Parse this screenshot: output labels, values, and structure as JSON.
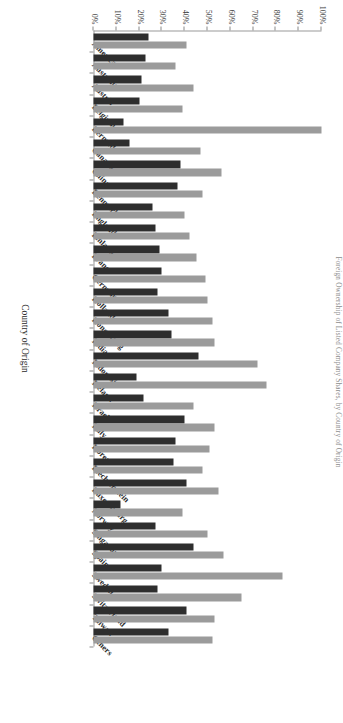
{
  "title": "Foreign Ownership of Listed Company Shares, by Country of Origin",
  "axis": {
    "value_title": "",
    "category_title": "Country of Origin",
    "value_ticks": [
      "100%",
      "90%",
      "80%",
      "70%",
      "60%",
      "50%",
      "40%",
      "30%",
      "20%",
      "10%",
      "0%"
    ],
    "value_min": 0,
    "value_max": 100
  },
  "colors": {
    "series_dark": "#2e2e2e",
    "series_light": "#9b9b9b",
    "axis": "#9a9a9a",
    "text": "#2b2b2b",
    "title": "#8d8d8d",
    "background": "#ffffff"
  },
  "chart_data": {
    "type": "bar",
    "title": "Foreign Ownership of Listed Company Shares, by Country of Origin",
    "xlabel": "Country of Origin",
    "ylabel": "",
    "ylim": [
      0,
      100
    ],
    "grid": false,
    "legend_position": "none",
    "orientation": "horizontal-rotated",
    "categories": [
      "America",
      "Australia",
      "Austria",
      "Belgium",
      "Bermuda",
      "Canada",
      "China",
      "Denmark",
      "England",
      "Finland",
      "France",
      "Germany",
      "Holland",
      "Hong Kong",
      "India",
      "Indonesia",
      "Ireland",
      "Israel",
      "Italy",
      "Korea",
      "Liechtenstein",
      "Luxembourg",
      "Norway",
      "Singapore",
      "Spain",
      "Sweden",
      "Switzerland",
      "Taiwan",
      "Others"
    ],
    "series": [
      {
        "name": "Series 1",
        "values": [
          24,
          23,
          21,
          20,
          13,
          16,
          38,
          37,
          26,
          27,
          29,
          30,
          28,
          33,
          34,
          46,
          19,
          22,
          40,
          36,
          35,
          41,
          12,
          27,
          44,
          30,
          28,
          41,
          33
        ]
      },
      {
        "name": "Series 2",
        "values": [
          41,
          36,
          44,
          39,
          100,
          47,
          56,
          48,
          40,
          42,
          45,
          49,
          50,
          52,
          53,
          72,
          76,
          44,
          53,
          51,
          48,
          55,
          39,
          50,
          57,
          83,
          65,
          53,
          52
        ]
      }
    ]
  }
}
